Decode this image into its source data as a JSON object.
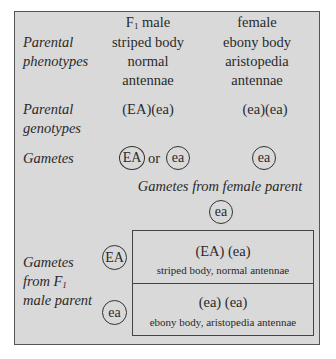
{
  "row_labels": {
    "parental_phenotypes": [
      "Parental",
      "phenotypes"
    ],
    "parental_genotypes": [
      "Parental",
      "genotypes"
    ],
    "gametes": "Gametes",
    "gametes_from_f1_male": [
      "Gametes",
      "from F",
      "1",
      "male parent"
    ]
  },
  "male": {
    "header_main": "F",
    "header_sub": "1",
    "header_rest": " male",
    "phenotype": [
      "striped body",
      "normal",
      "antennae"
    ],
    "genotype": "(EA)(ea)",
    "gamete_a": "EA",
    "gamete_or": "or",
    "gamete_b": "ea"
  },
  "female": {
    "header": "female",
    "phenotype": [
      "ebony body",
      "aristopedia",
      "antennae"
    ],
    "genotype": "(ea)(ea)",
    "gamete": "ea"
  },
  "cross": {
    "female_gametes_label": "Gametes from female parent",
    "female_gamete": "ea",
    "male_gametes": [
      "EA",
      "ea"
    ],
    "offspring": [
      {
        "genotype": "(EA) (ea)",
        "phenotype": "striped body, normal antennae"
      },
      {
        "genotype": "(ea) (ea)",
        "phenotype": "ebony body, aristopedia antennae"
      }
    ]
  },
  "colors": {
    "panel_bg": "#d9d9d9",
    "border": "#555555",
    "text": "#2a2a2a"
  }
}
